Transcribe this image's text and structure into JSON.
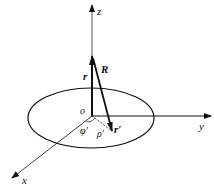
{
  "diagram": {
    "axes": {
      "z": "z",
      "y": "y",
      "x": "x",
      "origin": "o"
    },
    "vectors": {
      "r": "r",
      "R": "R",
      "r_prime": "r′"
    },
    "angles": {
      "phi_prime": "φ′",
      "rho_prime": "ρ′"
    },
    "colors": {
      "stroke": "#111111",
      "background": "#ffffff"
    }
  }
}
